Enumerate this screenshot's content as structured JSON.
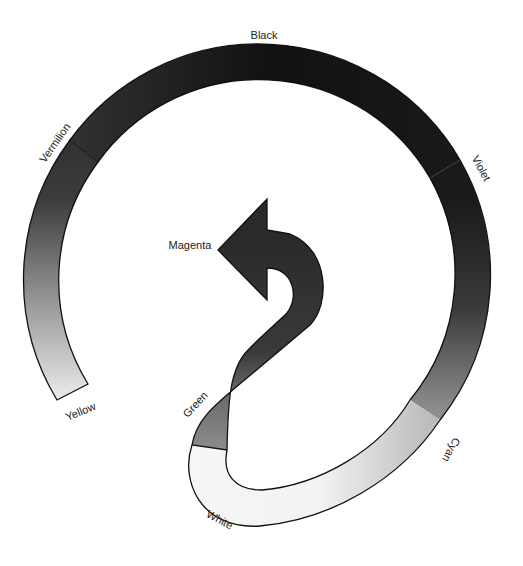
{
  "diagram": {
    "labels": {
      "black": "Black",
      "vermilion": "Vermilion",
      "violet": "Violet",
      "yellow": "Yellow",
      "magenta": "Magenta",
      "green": "Green",
      "cyan": "Cyan",
      "white": "White"
    },
    "sequence": [
      "Yellow",
      "Vermilion",
      "Black",
      "Violet",
      "Cyan",
      "White",
      "Green",
      "Magenta"
    ],
    "colors": {
      "yellow": "#e6e6e6",
      "vermilion": "#3a3a3a",
      "black": "#151515",
      "violet": "#1e1e1e",
      "cyan": "#9a9a9a",
      "white": "#f4f4f4",
      "green": "#808080",
      "magenta": "#2c2c2c",
      "outline": "#111111"
    }
  }
}
